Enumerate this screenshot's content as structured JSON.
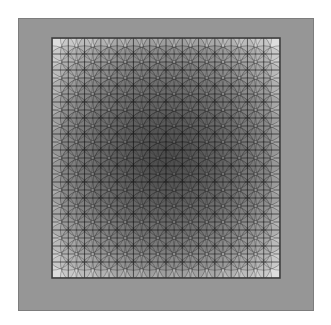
{
  "artwork": {
    "title": "Overlapping Circles Quilt Panel",
    "canvas": {
      "width": 331,
      "height": 325,
      "background_color": "#ffffff"
    },
    "frame": {
      "name": "outer-gray-border-band",
      "x": 18,
      "y": 18,
      "width": 295,
      "height": 292,
      "fill_color": "#969696",
      "stroke_color": "#7d7d7d",
      "stroke_width": 1
    },
    "panel": {
      "name": "inner-pattern-field",
      "x": 52,
      "y": 38,
      "width": 228,
      "height": 240,
      "background_color": "#ffffff",
      "stroke_color": "#3c3c3c",
      "stroke_width": 1.5
    },
    "grid": {
      "columns": 14,
      "rows": 15,
      "cell_width": 16.29,
      "cell_height": 16.0,
      "line_color": "#3f3f3f",
      "line_width": 0.9,
      "visible": true
    },
    "circles": {
      "radius_cells": 1.5,
      "placement": "grid-intersections",
      "fill_color": "#555555",
      "stroke_color": "#2e2e2e",
      "stroke_width": 0.9,
      "base_opacity": 0.16,
      "blend_mode": "multiply",
      "center_col": 7,
      "center_row": 7.5,
      "falloff": "radial-linear",
      "falloff_min_opacity": 0.03,
      "falloff_max_opacity": 0.34
    },
    "shading": {
      "description": "Radial intensity falloff: darkest at panel center, lightest toward edges",
      "center_tone": "#4a4a4a",
      "mid_tone": "#8f8f8f",
      "edge_tone": "#ededed",
      "vignette_inner_opacity": 0.3,
      "vignette_outer_opacity": 0.0
    }
  }
}
